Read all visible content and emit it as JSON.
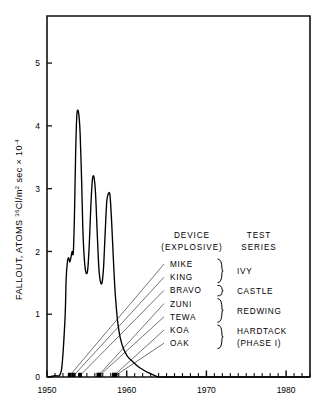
{
  "chart_data": {
    "type": "line",
    "title": "",
    "xlabel": "",
    "ylabel": "FALLOUT, ATOMS 36Cl/m2 sec x 10-4",
    "ylabel_parts": {
      "prefix": "FALLOUT, ATOMS ",
      "iso_sup": "36",
      "mid": "Cl/m",
      "m_sup": "2",
      "tail": " sec × 10",
      "exp_sup": "-4"
    },
    "xlim": [
      1950,
      1983
    ],
    "ylim": [
      0,
      5.75
    ],
    "xticks_major": [
      1950,
      1960,
      1970,
      1980
    ],
    "xticklabels": [
      "1950",
      "1960",
      "1970",
      "1980"
    ],
    "xtick_minor_step": 1,
    "yticks": [
      0,
      1,
      2,
      3,
      4,
      5
    ],
    "yticklabels": [
      "0",
      "1",
      "2",
      "3",
      "4",
      "5"
    ],
    "grid": false,
    "legend_position": "inside-right",
    "line_color": "#000000",
    "series": [
      {
        "name": "36Cl fallout",
        "x": [
          1950.0,
          1951.0,
          1951.8,
          1952.25,
          1952.4,
          1952.55,
          1952.7,
          1952.85,
          1953.0,
          1953.15,
          1953.3,
          1953.45,
          1953.6,
          1953.75,
          1953.95,
          1954.15,
          1954.35,
          1954.5,
          1954.7,
          1954.9,
          1955.1,
          1955.3,
          1955.5,
          1955.7,
          1955.9,
          1956.1,
          1956.3,
          1956.5,
          1956.7,
          1956.9,
          1957.1,
          1957.3,
          1957.5,
          1957.7,
          1957.9,
          1958.1,
          1958.3,
          1958.5,
          1958.7,
          1958.9,
          1959.2,
          1959.6,
          1960.1,
          1960.7,
          1961.3,
          1962.0,
          1962.7,
          1963.4,
          1964.0,
          1964.4,
          1965.0,
          1970.0,
          1980.0,
          1983.0
        ],
        "y": [
          0.0,
          0.02,
          0.1,
          0.9,
          1.55,
          1.82,
          1.9,
          1.83,
          1.9,
          2.0,
          1.98,
          2.6,
          3.6,
          4.18,
          4.22,
          3.9,
          3.1,
          2.35,
          1.85,
          1.66,
          1.7,
          2.1,
          2.72,
          3.15,
          3.18,
          2.9,
          2.3,
          1.75,
          1.52,
          1.5,
          1.75,
          2.3,
          2.8,
          2.92,
          2.9,
          2.5,
          1.95,
          1.45,
          1.1,
          0.85,
          0.62,
          0.45,
          0.33,
          0.25,
          0.18,
          0.12,
          0.07,
          0.03,
          0.0,
          0.0,
          0.0,
          0.0,
          0.0,
          0.0
        ],
        "peaks": [
          {
            "year": 1953.95,
            "value": 4.22
          },
          {
            "year": 1955.9,
            "value": 3.18
          },
          {
            "year": 1957.7,
            "value": 2.92
          }
        ]
      }
    ],
    "legend": {
      "col1_head_line1": "DEVICE",
      "col1_head_line2": "(EXPLOSIVE)",
      "col2_head_line1": "TEST",
      "col2_head_line2": "SERIES",
      "devices": [
        {
          "name": "MIKE",
          "event_year": 1952.85
        },
        {
          "name": "KING",
          "event_year": 1953.35
        },
        {
          "name": "BRAVO",
          "event_year": 1954.15
        },
        {
          "name": "ZUNI",
          "event_year": 1956.45
        },
        {
          "name": "TEWA",
          "event_year": 1956.6
        },
        {
          "name": "KOA",
          "event_year": 1958.4
        },
        {
          "name": "OAK",
          "event_year": 1958.6
        }
      ],
      "series_groups": [
        {
          "label": "IVY",
          "label2": "",
          "members": [
            "MIKE",
            "KING"
          ]
        },
        {
          "label": "CASTLE",
          "label2": "",
          "members": [
            "BRAVO"
          ]
        },
        {
          "label": "REDWING",
          "label2": "",
          "members": [
            "ZUNI",
            "TEWA"
          ]
        },
        {
          "label": "HARDTACK",
          "label2": "(PHASE I)",
          "members": [
            "KOA",
            "OAK"
          ]
        }
      ]
    }
  }
}
